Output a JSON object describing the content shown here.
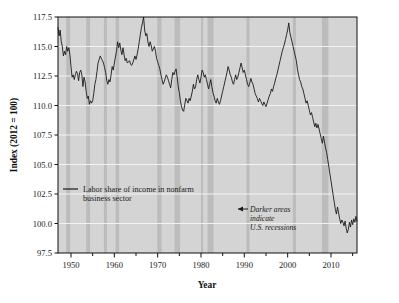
{
  "chart_data": {
    "type": "line",
    "title": "",
    "xlabel": "Year",
    "ylabel": "Index (2012 = 100)",
    "xlim": [
      1947,
      2016
    ],
    "ylim": [
      97.5,
      117.5
    ],
    "grid": true,
    "legend_position": "inside-left",
    "x_ticks_major": [
      1950,
      1960,
      1970,
      1980,
      1990,
      2000,
      2010
    ],
    "x_ticks_major_labels": [
      "1950",
      "1960",
      "1970",
      "1980",
      "1990",
      "2000",
      "2010"
    ],
    "x_ticks_minor": [
      1955,
      1965,
      1975,
      1985,
      1995,
      2005,
      2015
    ],
    "y_ticks": [
      97.5,
      100.0,
      102.5,
      105.0,
      107.5,
      110.0,
      112.5,
      115.0,
      117.5
    ],
    "y_tick_labels": [
      "97.5",
      "100.0",
      "102.5",
      "105.0",
      "107.5",
      "110.0",
      "112.5",
      "115.0",
      "117.5"
    ],
    "series": [
      {
        "name": "Labor share of income in nonfarm business sector",
        "color": "#1a1a1a",
        "x": [
          1947.0,
          1947.25,
          1947.5,
          1947.75,
          1948.0,
          1948.25,
          1948.5,
          1948.75,
          1949.0,
          1949.25,
          1949.5,
          1949.75,
          1950.0,
          1950.25,
          1950.5,
          1950.75,
          1951.0,
          1951.25,
          1951.5,
          1951.75,
          1952.0,
          1952.25,
          1952.5,
          1952.75,
          1953.0,
          1953.25,
          1953.5,
          1953.75,
          1954.0,
          1954.25,
          1954.5,
          1954.75,
          1955.0,
          1955.25,
          1955.5,
          1955.75,
          1956.0,
          1956.25,
          1956.5,
          1956.75,
          1957.0,
          1957.25,
          1957.5,
          1957.75,
          1958.0,
          1958.25,
          1958.5,
          1958.75,
          1959.0,
          1959.25,
          1959.5,
          1959.75,
          1960.0,
          1960.25,
          1960.5,
          1960.75,
          1961.0,
          1961.25,
          1961.5,
          1961.75,
          1962.0,
          1962.25,
          1962.5,
          1962.75,
          1963.0,
          1963.25,
          1963.5,
          1963.75,
          1964.0,
          1964.25,
          1964.5,
          1964.75,
          1965.0,
          1965.25,
          1965.5,
          1965.75,
          1966.0,
          1966.25,
          1966.5,
          1966.75,
          1967.0,
          1967.25,
          1967.5,
          1967.75,
          1968.0,
          1968.25,
          1968.5,
          1968.75,
          1969.0,
          1969.25,
          1969.5,
          1969.75,
          1970.0,
          1970.25,
          1970.5,
          1970.75,
          1971.0,
          1971.25,
          1971.5,
          1971.75,
          1972.0,
          1972.25,
          1972.5,
          1972.75,
          1973.0,
          1973.25,
          1973.5,
          1973.75,
          1974.0,
          1974.25,
          1974.5,
          1974.75,
          1975.0,
          1975.25,
          1975.5,
          1975.75,
          1976.0,
          1976.25,
          1976.5,
          1976.75,
          1977.0,
          1977.25,
          1977.5,
          1977.75,
          1978.0,
          1978.25,
          1978.5,
          1978.75,
          1979.0,
          1979.25,
          1979.5,
          1979.75,
          1980.0,
          1980.25,
          1980.5,
          1980.75,
          1981.0,
          1981.25,
          1981.5,
          1981.75,
          1982.0,
          1982.25,
          1982.5,
          1982.75,
          1983.0,
          1983.25,
          1983.5,
          1983.75,
          1984.0,
          1984.25,
          1984.5,
          1984.75,
          1985.0,
          1985.25,
          1985.5,
          1985.75,
          1986.0,
          1986.25,
          1986.5,
          1986.75,
          1987.0,
          1987.25,
          1987.5,
          1987.75,
          1988.0,
          1988.25,
          1988.5,
          1988.75,
          1989.0,
          1989.25,
          1989.5,
          1989.75,
          1990.0,
          1990.25,
          1990.5,
          1990.75,
          1991.0,
          1991.25,
          1991.5,
          1991.75,
          1992.0,
          1992.25,
          1992.5,
          1992.75,
          1993.0,
          1993.25,
          1993.5,
          1993.75,
          1994.0,
          1994.25,
          1994.5,
          1994.75,
          1995.0,
          1995.25,
          1995.5,
          1995.75,
          1996.0,
          1996.25,
          1996.5,
          1996.75,
          1997.0,
          1997.25,
          1997.5,
          1997.75,
          1998.0,
          1998.25,
          1998.5,
          1998.75,
          1999.0,
          1999.25,
          1999.5,
          1999.75,
          2000.0,
          2000.25,
          2000.5,
          2000.75,
          2001.0,
          2001.25,
          2001.5,
          2001.75,
          2002.0,
          2002.25,
          2002.5,
          2002.75,
          2003.0,
          2003.25,
          2003.5,
          2003.75,
          2004.0,
          2004.25,
          2004.5,
          2004.75,
          2005.0,
          2005.25,
          2005.5,
          2005.75,
          2006.0,
          2006.25,
          2006.5,
          2006.75,
          2007.0,
          2007.25,
          2007.5,
          2007.75,
          2008.0,
          2008.25,
          2008.5,
          2008.75,
          2009.0,
          2009.25,
          2009.5,
          2009.75,
          2010.0,
          2010.25,
          2010.5,
          2010.75,
          2011.0,
          2011.25,
          2011.5,
          2011.75,
          2012.0,
          2012.25,
          2012.5,
          2012.75,
          2013.0,
          2013.25,
          2013.5,
          2013.75,
          2014.0,
          2014.25,
          2014.5,
          2014.75,
          2015.0,
          2015.25,
          2015.5,
          2015.75,
          2016.0
        ],
        "values": [
          116.6,
          115.9,
          116.4,
          115.4,
          115.0,
          114.2,
          114.6,
          114.3,
          115.0,
          114.6,
          114.9,
          114.3,
          113.3,
          112.4,
          112.6,
          112.2,
          112.6,
          112.9,
          112.7,
          112.1,
          112.8,
          113.0,
          112.6,
          111.6,
          112.4,
          112.0,
          111.2,
          110.6,
          110.8,
          110.1,
          110.4,
          110.2,
          110.4,
          111.0,
          111.8,
          112.2,
          112.9,
          113.6,
          113.9,
          114.2,
          114.0,
          113.8,
          113.6,
          113.2,
          112.8,
          112.1,
          111.8,
          112.2,
          112.0,
          112.6,
          113.3,
          113.0,
          113.6,
          114.1,
          114.6,
          115.4,
          114.9,
          115.3,
          114.7,
          114.3,
          114.9,
          114.3,
          113.8,
          114.0,
          113.6,
          113.7,
          113.8,
          113.5,
          113.4,
          113.6,
          113.9,
          114.2,
          113.9,
          114.3,
          114.8,
          115.4,
          116.0,
          116.6,
          117.0,
          117.5,
          116.4,
          115.9,
          116.1,
          115.4,
          115.0,
          115.4,
          115.1,
          114.6,
          114.8,
          115.0,
          114.6,
          114.0,
          113.7,
          113.4,
          113.1,
          112.6,
          112.2,
          111.8,
          112.0,
          112.3,
          112.6,
          112.4,
          112.1,
          111.8,
          111.5,
          112.2,
          112.8,
          112.6,
          112.9,
          113.1,
          112.4,
          111.6,
          111.1,
          110.4,
          109.9,
          109.6,
          109.5,
          110.1,
          110.6,
          110.4,
          110.2,
          110.6,
          110.4,
          110.8,
          111.2,
          111.8,
          111.4,
          111.6,
          112.2,
          112.6,
          112.2,
          111.9,
          112.4,
          113.0,
          112.8,
          112.4,
          112.6,
          112.2,
          111.8,
          111.4,
          111.8,
          112.2,
          111.6,
          111.1,
          110.8,
          110.4,
          110.2,
          110.6,
          110.3,
          110.1,
          110.4,
          110.8,
          111.2,
          111.6,
          112.0,
          112.4,
          112.8,
          113.3,
          113.0,
          112.6,
          112.4,
          112.0,
          111.8,
          112.2,
          112.6,
          112.2,
          112.4,
          112.8,
          113.2,
          113.6,
          113.2,
          112.8,
          113.0,
          112.6,
          112.2,
          111.8,
          111.6,
          111.9,
          112.3,
          112.0,
          111.8,
          111.4,
          111.0,
          110.8,
          110.6,
          110.3,
          110.6,
          110.4,
          110.2,
          110.0,
          110.3,
          110.1,
          109.9,
          110.2,
          110.5,
          110.8,
          111.0,
          111.4,
          111.2,
          111.6,
          111.9,
          112.3,
          112.6,
          113.0,
          113.4,
          113.8,
          114.2,
          114.6,
          114.9,
          115.2,
          115.6,
          116.0,
          116.4,
          117.0,
          116.2,
          115.8,
          115.4,
          115.0,
          114.6,
          114.2,
          113.8,
          113.1,
          112.6,
          112.2,
          112.0,
          111.6,
          111.4,
          111.0,
          110.6,
          110.2,
          110.4,
          110.0,
          109.6,
          109.2,
          109.4,
          109.0,
          108.6,
          108.2,
          108.5,
          108.1,
          108.4,
          108.0,
          107.6,
          107.2,
          106.8,
          107.4,
          106.9,
          106.4,
          106.0,
          105.4,
          104.8,
          104.2,
          103.6,
          103.0,
          102.4,
          101.8,
          101.2,
          100.8,
          101.4,
          100.9,
          100.4,
          100.0,
          100.3,
          100.1,
          99.8,
          100.2,
          99.6,
          99.2,
          99.5,
          100.1,
          99.7,
          100.3,
          99.9,
          100.4,
          100.1,
          100.6,
          100.2
        ]
      }
    ],
    "recession_bands": [
      {
        "start": 1948.9,
        "end": 1949.8
      },
      {
        "start": 1953.5,
        "end": 1954.4
      },
      {
        "start": 1957.6,
        "end": 1958.3
      },
      {
        "start": 1960.3,
        "end": 1961.1
      },
      {
        "start": 1969.9,
        "end": 1970.9
      },
      {
        "start": 1973.9,
        "end": 1975.2
      },
      {
        "start": 1980.0,
        "end": 1980.5
      },
      {
        "start": 1981.5,
        "end": 1982.9
      },
      {
        "start": 1990.5,
        "end": 1991.2
      },
      {
        "start": 2001.2,
        "end": 2001.9
      },
      {
        "start": 2007.9,
        "end": 2009.4
      }
    ],
    "annotation": {
      "lines": [
        "Darker areas",
        "indicate",
        "U.S. recessions"
      ],
      "arrow": "left-arrow"
    },
    "colors": {
      "plot_background": "#d4d4d4",
      "recession_band": "#bcbcbc",
      "gridline": "#f2f2f2",
      "line": "#1a1a1a",
      "axis": "#111111",
      "page_background": "#ffffff"
    }
  },
  "legend": {
    "swatch": "line-swatch",
    "line1": "Labor share of income in nonfarm",
    "line2": "business sector"
  },
  "axes": {
    "y_title": "Index (2012 = 100)",
    "x_title": "Year"
  }
}
